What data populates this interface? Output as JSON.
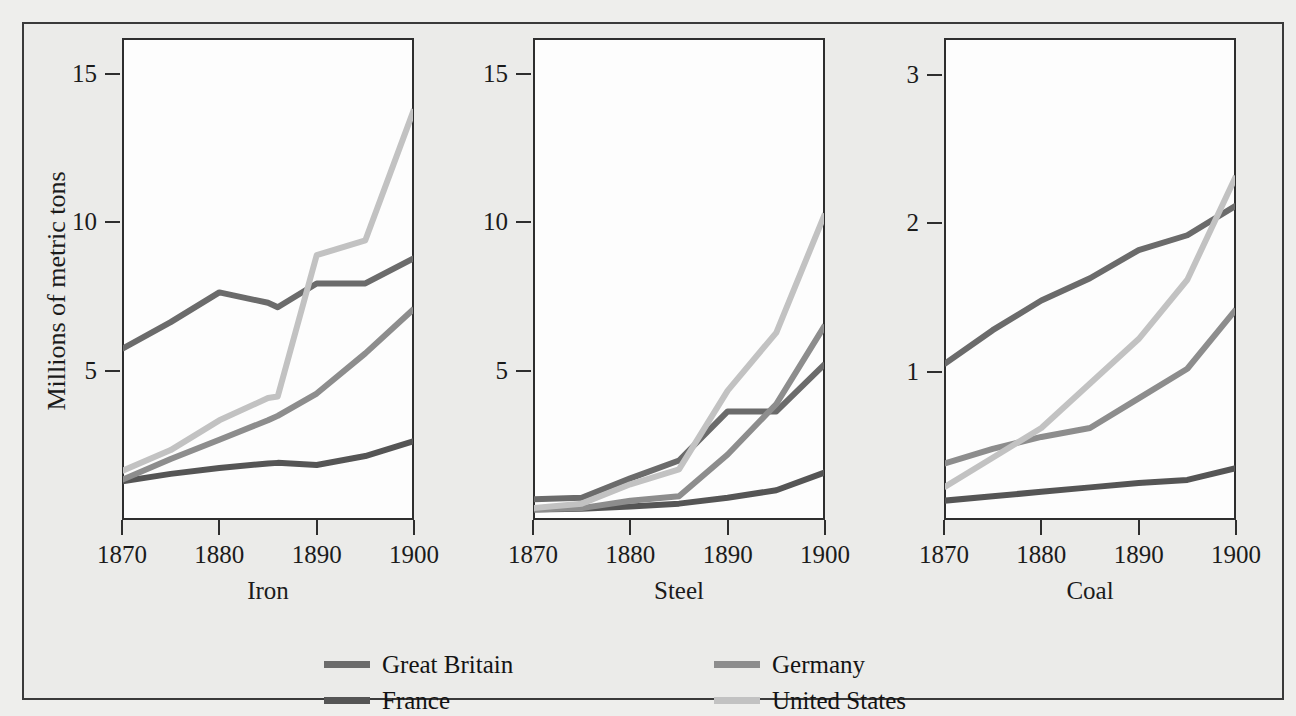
{
  "figure": {
    "y_axis_label": "Millions of metric tons",
    "background_color": "#eeeeec",
    "frame_color": "#3a3a3a",
    "plot_background": "#fdfdfd"
  },
  "legend": {
    "position": "bottom",
    "entries": [
      {
        "label": "Great Britain",
        "color": "#6b6b6b"
      },
      {
        "label": "France",
        "color": "#555555"
      },
      {
        "label": "Germany",
        "color": "#8d8d8d"
      },
      {
        "label": "United States",
        "color": "#c2c2c2"
      }
    ]
  },
  "chart_data": [
    {
      "type": "line",
      "title": "Iron",
      "xlabel": "Iron",
      "ylabel": "Millions of metric tons",
      "x": [
        1870,
        1875,
        1880,
        1885,
        1886,
        1890,
        1895,
        1900
      ],
      "xlim": [
        1870,
        1900
      ],
      "ylim": [
        0,
        16.2
      ],
      "xticks": [
        1870,
        1880,
        1890,
        1900
      ],
      "yticks": [
        5,
        10,
        15
      ],
      "grid": false,
      "series": [
        {
          "name": "Great Britain",
          "color": "#6b6b6b",
          "values": [
            5.75,
            6.65,
            7.65,
            7.3,
            7.15,
            7.95,
            7.95,
            8.8
          ]
        },
        {
          "name": "France",
          "color": "#555555",
          "values": [
            1.3,
            1.55,
            1.75,
            1.9,
            1.92,
            1.85,
            2.15,
            2.65
          ]
        },
        {
          "name": "Germany",
          "color": "#8d8d8d",
          "values": [
            1.35,
            2.05,
            2.7,
            3.35,
            3.5,
            4.25,
            5.6,
            7.1
          ]
        },
        {
          "name": "United States",
          "color": "#c2c2c2",
          "values": [
            1.65,
            2.35,
            3.35,
            4.1,
            4.15,
            8.9,
            9.4,
            13.8
          ]
        }
      ]
    },
    {
      "type": "line",
      "title": "Steel",
      "xlabel": "Steel",
      "ylabel": "",
      "x": [
        1870,
        1875,
        1880,
        1885,
        1890,
        1895,
        1900
      ],
      "xlim": [
        1870,
        1900
      ],
      "ylim": [
        0,
        16.2
      ],
      "xticks": [
        1870,
        1880,
        1890,
        1900
      ],
      "yticks": [
        5,
        10,
        15
      ],
      "grid": false,
      "series": [
        {
          "name": "Great Britain",
          "color": "#6b6b6b",
          "values": [
            0.7,
            0.75,
            1.4,
            2.0,
            3.65,
            3.65,
            5.25
          ]
        },
        {
          "name": "France",
          "color": "#555555",
          "values": [
            0.35,
            0.38,
            0.45,
            0.55,
            0.75,
            1.0,
            1.6
          ]
        },
        {
          "name": "Germany",
          "color": "#8d8d8d",
          "values": [
            0.35,
            0.4,
            0.65,
            0.8,
            2.2,
            3.9,
            6.55
          ]
        },
        {
          "name": "United States",
          "color": "#c2c2c2",
          "values": [
            0.4,
            0.55,
            1.2,
            1.7,
            4.35,
            6.3,
            10.3
          ]
        }
      ]
    },
    {
      "type": "line",
      "title": "Coal",
      "xlabel": "Coal",
      "ylabel": "",
      "x": [
        1870,
        1875,
        1880,
        1885,
        1890,
        1895,
        1900
      ],
      "xlim": [
        1870,
        1900
      ],
      "ylim": [
        0,
        3.25
      ],
      "xticks": [
        1870,
        1880,
        1890,
        1900
      ],
      "yticks": [
        1,
        2,
        3
      ],
      "grid": false,
      "series": [
        {
          "name": "Great Britain",
          "color": "#6b6b6b",
          "values": [
            1.05,
            1.28,
            1.48,
            1.63,
            1.82,
            1.92,
            2.12
          ]
        },
        {
          "name": "France",
          "color": "#555555",
          "values": [
            0.13,
            0.16,
            0.19,
            0.22,
            0.25,
            0.27,
            0.35
          ]
        },
        {
          "name": "Germany",
          "color": "#8d8d8d",
          "values": [
            0.38,
            0.48,
            0.56,
            0.62,
            0.82,
            1.02,
            1.42
          ]
        },
        {
          "name": "United States",
          "color": "#c2c2c2",
          "values": [
            0.22,
            0.42,
            0.62,
            0.92,
            1.22,
            1.62,
            2.32
          ]
        }
      ]
    }
  ]
}
